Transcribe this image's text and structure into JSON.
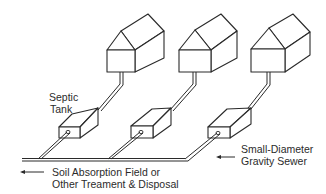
{
  "diagram": {
    "labels": {
      "septic_tank_line1": "Septic",
      "septic_tank_line2": "Tank",
      "sewer_line1": "Small-Diameter",
      "sewer_line2": "Gravity Sewer",
      "disposal_line1": "Soil Absorption Field or",
      "disposal_line2": "Other Treament & Disposal"
    },
    "components": {
      "houses": 3,
      "septic_tanks": 3
    },
    "colors": {
      "line": "#2a2a2a",
      "text": "#2b2b2b",
      "background": "#ffffff"
    },
    "icons": {
      "arrow_left": "arrow-left-icon"
    }
  }
}
